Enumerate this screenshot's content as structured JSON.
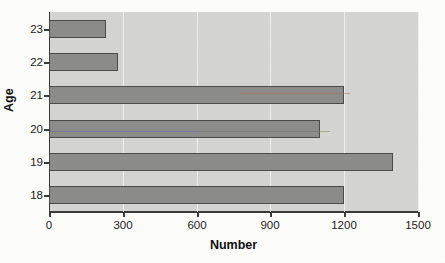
{
  "chart_data": {
    "type": "bar",
    "orientation": "horizontal",
    "title": "",
    "xlabel": "Number",
    "ylabel": "Age",
    "categories": [
      "23",
      "22",
      "21",
      "20",
      "19",
      "18"
    ],
    "values": [
      230,
      280,
      1200,
      1100,
      1400,
      1200
    ],
    "series": [
      {
        "name": "Number",
        "values": [
          230,
          280,
          1200,
          1100,
          1400,
          1200
        ]
      }
    ],
    "xlim": [
      0,
      1500
    ],
    "xticks": [
      "0",
      "300",
      "600",
      "900",
      "1200",
      "1500"
    ],
    "xtick_values": [
      0,
      300,
      600,
      900,
      1200,
      1500
    ],
    "grid": true,
    "grid_axis": "x",
    "legend": false,
    "bar_color": "#8c8c8a",
    "bar_edge_color": "#4a4a4a",
    "plot_background": "#d4d4d2",
    "figure_background": "#fdfdfb",
    "axis_color": "#3a3a3a",
    "gridline_color": "#efefed"
  },
  "axes": {
    "x_title": "Number",
    "y_title": "Age"
  }
}
